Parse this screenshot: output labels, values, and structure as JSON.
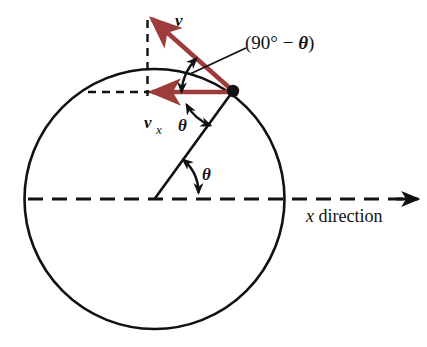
{
  "figure": {
    "type": "physics-vector-diagram",
    "background_color": "#ffffff",
    "stroke_color": "#111111",
    "vector_color": "#9e3b3b",
    "labels": {
      "velocity_vector": "v",
      "velocity_x_vector": "v",
      "velocity_x_subscript": "x",
      "angle_complement_open": "(90",
      "angle_complement_degree": "°",
      "angle_complement_minus": " − ",
      "angle_complement_theta": "θ",
      "angle_complement_close": ")",
      "angle_complement_full": "(90° − θ)",
      "theta_upper": "θ",
      "theta_lower": "θ",
      "axis_x_symbol": "x",
      "axis_x_word": " direction",
      "axis_full": "x direction"
    },
    "geometry": {
      "circle_center_x": 154.5,
      "circle_center_y": 199.0,
      "circle_radius": 130.0,
      "contact_point_x": 233.0,
      "contact_point_y": 91.0,
      "velocity_tip_x": 150.0,
      "velocity_tip_y": 17.0,
      "velocity_x_tip_x": 150.0,
      "velocity_x_tip_y": 92.0,
      "dashed_vertical_x": 147.5,
      "dashed_vertical_top_y": 20.0,
      "dashed_vertical_bottom_y": 95.0,
      "dashed_horizontal_y": 92.0,
      "dashed_horizontal_left_x": 88.0,
      "axis_line_y": 199.0,
      "axis_line_left_x": 28.0,
      "axis_arrow_tip_x": 418.0
    }
  }
}
